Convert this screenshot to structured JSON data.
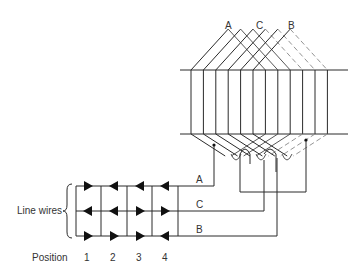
{
  "figure": {
    "phase_labels_top": [
      "A",
      "C",
      "B"
    ],
    "line_labels": [
      "A",
      "C",
      "B"
    ],
    "line_wires_label": "Line wires",
    "position_label": "Position",
    "positions": [
      "1",
      "2",
      "3",
      "4"
    ],
    "arrow_directions": {
      "row_A": [
        "right",
        "left",
        "left",
        "left"
      ],
      "row_C": [
        "left",
        "left",
        "right",
        "right"
      ],
      "row_B": [
        "right",
        "right",
        "right",
        "left"
      ]
    }
  }
}
